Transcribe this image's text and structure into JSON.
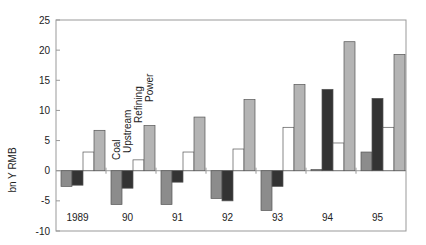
{
  "chart_data": {
    "type": "bar",
    "title": "",
    "xlabel": "",
    "ylabel": "bn Y RMB",
    "ylim": [
      -10,
      25
    ],
    "yticks": [
      -10,
      -5,
      0,
      5,
      10,
      15,
      20,
      25
    ],
    "grid": false,
    "categories": [
      "1989",
      "90",
      "91",
      "92",
      "93",
      "94",
      "95"
    ],
    "series": [
      {
        "name": "Coal",
        "color": "#8c8c8c",
        "values": [
          -2.6,
          -5.6,
          -5.6,
          -4.6,
          -6.6,
          0.2,
          3.1
        ]
      },
      {
        "name": "Upstream",
        "color": "#333333",
        "values": [
          -2.4,
          -2.9,
          -1.9,
          -5.0,
          -2.6,
          13.5,
          12.0
        ]
      },
      {
        "name": "Refining",
        "color": "#ffffff",
        "values": [
          3.1,
          1.8,
          3.1,
          3.6,
          7.2,
          4.6,
          7.2
        ]
      },
      {
        "name": "Power",
        "color": "#b4b4b4",
        "values": [
          6.7,
          7.5,
          8.9,
          11.8,
          14.3,
          21.4,
          19.3
        ]
      }
    ],
    "legend": {
      "position": "inline-rotated-labels-above-90-group",
      "entries": [
        "Coal",
        "Upstream",
        "Refining",
        "Power"
      ]
    }
  }
}
